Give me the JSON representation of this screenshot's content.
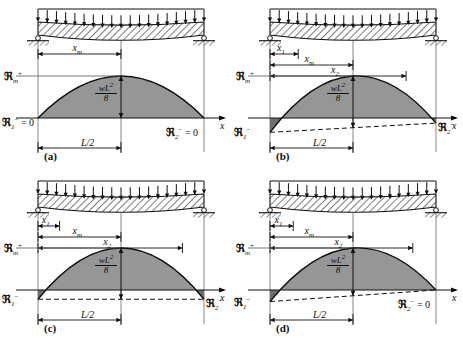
{
  "figure": {
    "colors": {
      "line": "#101010",
      "fill_positive": "#969696",
      "fill_negative": "#6e6e6e",
      "background": "#ffffff",
      "hatch": "#101010"
    },
    "axis_label_x": "x",
    "load_symbol": "w",
    "moment_value_numerator": "wL",
    "moment_value_exponent": "2",
    "moment_value_denominator": "8",
    "span_half_label": "L/2"
  },
  "panels": [
    {
      "id": "a",
      "caption": "(a)",
      "description": "Simply supported beam, both end moments zero",
      "dimensions": [
        {
          "name": "x_m",
          "base": "x",
          "sub": "m",
          "start_frac": 0.0,
          "end_frac": 0.5
        }
      ],
      "labels": {
        "m_max": {
          "base": "ℜ",
          "sub": "m",
          "sup": "+"
        },
        "m_left": {
          "base": "ℜ",
          "sub": "1",
          "sup": "−",
          "equals": " = 0"
        },
        "m_right": {
          "base": "ℜ",
          "sub": "2",
          "sup": "−",
          "equals": " = 0"
        },
        "axis": "x",
        "half_span": "L/2",
        "peak_value_num": "wL",
        "peak_value_exp": "2",
        "peak_value_den": "8"
      },
      "end_moment_left": 0.0,
      "end_moment_right": 0.0,
      "chord_style": "none",
      "supports": [
        "pin",
        "roller"
      ]
    },
    {
      "id": "b",
      "caption": "(b)",
      "description": "Both ends partially restrained, unequal negative end moments",
      "dimensions": [
        {
          "name": "x_1",
          "base": "x",
          "sub": "1",
          "start_frac": 0.0,
          "end_frac": 0.17
        },
        {
          "name": "x_m",
          "base": "x",
          "sub": "m",
          "start_frac": 0.0,
          "end_frac": 0.5
        },
        {
          "name": "x_2",
          "base": "x",
          "sub": "2",
          "start_frac": 0.0,
          "end_frac": 0.82
        }
      ],
      "labels": {
        "m_max": {
          "base": "ℜ",
          "sub": "m",
          "sup": "+"
        },
        "m_left": {
          "base": "ℜ",
          "sub": "1",
          "sup": "−",
          "equals": ""
        },
        "m_right": {
          "base": "ℜ",
          "sub": "2",
          "sup": "−",
          "equals": ""
        },
        "axis": "x",
        "half_span": "L/2",
        "peak_value_num": "wL",
        "peak_value_exp": "2",
        "peak_value_den": "8"
      },
      "end_moment_left": -0.62,
      "end_moment_right": -0.22,
      "chord_style": "dashed-sloped",
      "supports": [
        "roller",
        "roller"
      ]
    },
    {
      "id": "c",
      "caption": "(c)",
      "description": "Both ends equally restrained, equal negative end moments",
      "dimensions": [
        {
          "name": "x_1",
          "base": "x",
          "sub": "1",
          "start_frac": 0.0,
          "end_frac": 0.13
        },
        {
          "name": "x_m",
          "base": "x",
          "sub": "m",
          "start_frac": 0.0,
          "end_frac": 0.5
        },
        {
          "name": "x_2",
          "base": "x",
          "sub": "2",
          "start_frac": 0.0,
          "end_frac": 0.87
        }
      ],
      "labels": {
        "m_max": {
          "base": "ℜ",
          "sub": "m",
          "sup": "+"
        },
        "m_left": {
          "base": "ℜ",
          "sub": "1",
          "sup": "−",
          "equals": ""
        },
        "m_right": {
          "base": "ℜ",
          "sub": "2",
          "sup": "−",
          "equals": ""
        },
        "axis": "x",
        "half_span": "L/2",
        "peak_value_num": "wL",
        "peak_value_exp": "2",
        "peak_value_den": "8"
      },
      "end_moment_left": -0.4,
      "end_moment_right": -0.4,
      "chord_style": "dashed-level",
      "supports": [
        "roller",
        "roller"
      ]
    },
    {
      "id": "d",
      "caption": "(d)",
      "description": "Left end restrained, right end moment zero",
      "dimensions": [
        {
          "name": "x_1",
          "base": "x",
          "sub": "1",
          "start_frac": 0.0,
          "end_frac": 0.14
        },
        {
          "name": "x_m",
          "base": "x",
          "sub": "m",
          "start_frac": 0.0,
          "end_frac": 0.5
        },
        {
          "name": "x_2",
          "base": "x",
          "sub": "2",
          "start_frac": 0.0,
          "end_frac": 0.86
        }
      ],
      "labels": {
        "m_max": {
          "base": "ℜ",
          "sub": "m",
          "sup": "+"
        },
        "m_left": {
          "base": "ℜ",
          "sub": "1",
          "sup": "−",
          "equals": ""
        },
        "m_right": {
          "base": "ℜ",
          "sub": "2",
          "sup": "−",
          "equals": " = 0"
        },
        "axis": "x",
        "half_span": "L/2",
        "peak_value_num": "wL",
        "peak_value_exp": "2",
        "peak_value_den": "8"
      },
      "end_moment_left": -0.5,
      "end_moment_right": 0.0,
      "chord_style": "dashed-sloped",
      "supports": [
        "roller",
        "roller"
      ]
    }
  ]
}
